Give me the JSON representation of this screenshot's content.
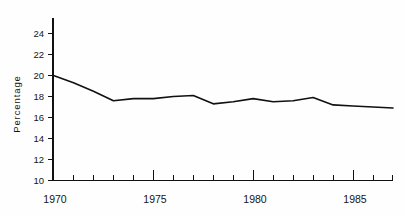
{
  "chart_data": {
    "type": "line",
    "title": "",
    "xlabel": "",
    "ylabel": "Percentage",
    "xlim": [
      1970,
      1987
    ],
    "ylim": [
      10,
      24.8
    ],
    "grid": false,
    "legend": false,
    "x": [
      1970,
      1971,
      1972,
      1973,
      1974,
      1975,
      1976,
      1977,
      1978,
      1979,
      1980,
      1981,
      1982,
      1983,
      1984,
      1985,
      1986,
      1987
    ],
    "values": [
      20.0,
      19.3,
      18.5,
      17.6,
      17.8,
      17.8,
      18.0,
      18.1,
      17.3,
      17.5,
      17.8,
      17.5,
      17.6,
      17.9,
      17.2,
      17.1,
      17.0,
      16.9
    ],
    "series": [
      {
        "name": "Percentage",
        "values": [
          20.0,
          19.3,
          18.5,
          17.6,
          17.8,
          17.8,
          18.0,
          18.1,
          17.3,
          17.5,
          17.8,
          17.5,
          17.6,
          17.9,
          17.2,
          17.1,
          17.0,
          16.9
        ],
        "color": "#111111"
      }
    ],
    "y_ticks": [
      10,
      12,
      14,
      16,
      18,
      20,
      22,
      24
    ],
    "y_tick_labels": [
      "10",
      "12",
      "14",
      "16",
      "18",
      "20",
      "22",
      "24"
    ],
    "x_major_ticks": [
      1970,
      1975,
      1980,
      1985
    ],
    "x_major_tick_labels": [
      "1970",
      "1975",
      "1980",
      "1985"
    ],
    "x_minor_ticks": [
      1971,
      1972,
      1973,
      1974,
      1976,
      1977,
      1978,
      1979,
      1981,
      1982,
      1983,
      1984,
      1986,
      1987
    ],
    "line_color": "#111111",
    "axis_color": "#111111",
    "background_color": "#fefefe"
  },
  "axes": {
    "y_axis_label": "Percentage",
    "y_tick_labels": [
      "24",
      "22",
      "20",
      "18",
      "16",
      "14",
      "12",
      "10"
    ],
    "x_tick_labels": [
      "1970",
      "1975",
      "1980",
      "1985"
    ]
  }
}
